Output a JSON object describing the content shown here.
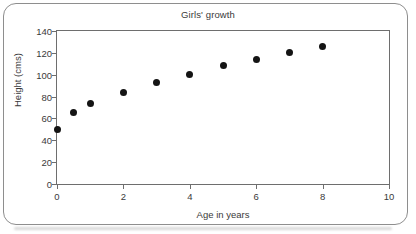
{
  "chart_data": {
    "type": "scatter",
    "title": "Girls' growth",
    "xlabel": "Age in years",
    "ylabel": "Height (cms)",
    "xlim": [
      0,
      10
    ],
    "ylim": [
      0,
      140
    ],
    "xticks": [
      0,
      2,
      4,
      6,
      8,
      10
    ],
    "yticks": [
      0,
      20,
      40,
      60,
      80,
      100,
      120,
      140
    ],
    "xtick_labels": [
      "0",
      "2",
      "4",
      "6",
      "8",
      "10"
    ],
    "ytick_labels": [
      "0",
      "20",
      "40",
      "60",
      "80",
      "100",
      "120",
      "140"
    ],
    "grid": false,
    "legend": null,
    "series": [
      {
        "name": "Girls' growth",
        "marker": "filled-circle",
        "color": "#141414",
        "points": [
          {
            "x": 0,
            "y": 50
          },
          {
            "x": 0.5,
            "y": 65
          },
          {
            "x": 1,
            "y": 74
          },
          {
            "x": 2,
            "y": 84
          },
          {
            "x": 3,
            "y": 92.5
          },
          {
            "x": 4,
            "y": 100.5
          },
          {
            "x": 5,
            "y": 108
          },
          {
            "x": 6,
            "y": 113.5
          },
          {
            "x": 7,
            "y": 120
          },
          {
            "x": 8,
            "y": 126
          }
        ]
      }
    ]
  },
  "style": {
    "axis_color": "#6e6e6e",
    "text_color": "#3a3a3a",
    "marker_color": "#141414",
    "card_border_color": "#8e8e8e",
    "background": "#ffffff"
  }
}
